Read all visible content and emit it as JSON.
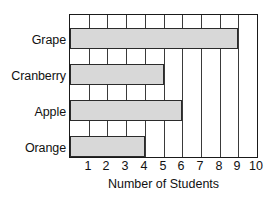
{
  "chart_data": {
    "type": "bar",
    "orientation": "horizontal",
    "title": "",
    "xlabel": "Number of Students",
    "ylabel": "",
    "categories": [
      "Grape",
      "Cranberry",
      "Apple",
      "Orange"
    ],
    "values": [
      9,
      5,
      6,
      4
    ],
    "xlim": [
      0,
      10
    ],
    "xticks": [
      1,
      2,
      3,
      4,
      5,
      6,
      7,
      8,
      9,
      10
    ],
    "xtick_labels": [
      "1",
      "2",
      "3",
      "4",
      "5",
      "6",
      "7",
      "8",
      "9",
      "10"
    ],
    "grid": "vertical",
    "legend": "none",
    "colors": {
      "bar_fill": "#d8d8d8",
      "bar_border": "#2b2b2b",
      "axis": "#1a1a1a",
      "gridline": "#3a3a3a",
      "text": "#111111",
      "background": "#ffffff"
    }
  }
}
